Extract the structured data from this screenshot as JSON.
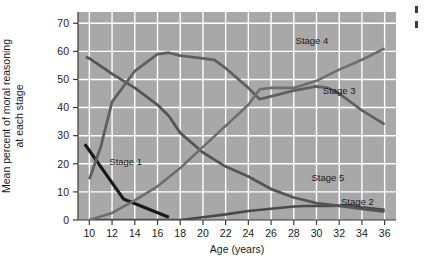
{
  "chart_data": {
    "type": "line",
    "title": "",
    "xlabel": "Age (years)",
    "ylabel": "Mean percent of moral reasoning at each stage",
    "xlim": [
      9,
      37
    ],
    "ylim": [
      0,
      74
    ],
    "xticks": [
      10,
      12,
      14,
      16,
      18,
      20,
      22,
      24,
      26,
      28,
      30,
      32,
      34,
      36
    ],
    "yticks": [
      0,
      10,
      20,
      30,
      40,
      50,
      60,
      70
    ],
    "grid": true,
    "legend_position": "inline-labels",
    "plot_background": "#a8a8a8",
    "gridline_color": "#ffffff",
    "series": [
      {
        "name": "Stage 1",
        "label": "Stage 1",
        "color": "#1a1a1a",
        "width": 3.2,
        "label_x": 13.2,
        "label_y": 19.5,
        "x": [
          9.6,
          13,
          17
        ],
        "y": [
          27,
          7.5,
          1
        ]
      },
      {
        "name": "Stage 2",
        "label": "Stage 2",
        "color": "#4a4a4a",
        "width": 2.6,
        "label_x": 33.6,
        "label_y": 5.2,
        "x": [
          10,
          13,
          17,
          18,
          20,
          22,
          24,
          26,
          28,
          29,
          31,
          33,
          34,
          36
        ],
        "y": [
          0,
          0,
          0,
          0,
          1,
          2,
          3.2,
          4,
          4.8,
          5,
          5,
          5.2,
          4.5,
          3.6
        ]
      },
      {
        "name": "Stage 3",
        "label": "Stage 3",
        "color": "#555555",
        "width": 2.8,
        "label_x": 32.0,
        "label_y": 45.0,
        "x": [
          9.7,
          10,
          12,
          13,
          14,
          16,
          17,
          18,
          20,
          22,
          24,
          26,
          28,
          30,
          32,
          34,
          36
        ],
        "y": [
          58,
          57.5,
          52,
          49.5,
          47,
          41,
          37,
          31,
          24,
          19,
          15.5,
          11,
          8,
          6,
          5,
          4,
          3
        ]
      },
      {
        "name": "Stage 4",
        "label": "Stage 4",
        "color": "#606060",
        "width": 2.8,
        "label_x": 29.6,
        "label_y": 62.5,
        "x": [
          10,
          11,
          12,
          14,
          16,
          17,
          18,
          20,
          21,
          22,
          24,
          25,
          26,
          28,
          30,
          31,
          32,
          34,
          36
        ],
        "y": [
          14.5,
          26,
          42,
          53,
          59,
          59.5,
          58.5,
          57.5,
          57,
          54,
          47,
          43,
          44,
          46,
          47.5,
          47,
          45,
          39,
          34
        ]
      },
      {
        "name": "Stage 5",
        "label": "Stage 5",
        "color": "#6e6e6e",
        "width": 2.6,
        "label_x": 31.0,
        "label_y": 13.8,
        "x": [
          10,
          12,
          14,
          16,
          18,
          20,
          22,
          24,
          25,
          26,
          28,
          30,
          32,
          34,
          36
        ],
        "y": [
          0,
          2.5,
          7,
          12,
          18.5,
          26,
          33.5,
          41,
          46.5,
          47,
          47,
          49.5,
          53.5,
          57,
          61
        ]
      }
    ]
  }
}
